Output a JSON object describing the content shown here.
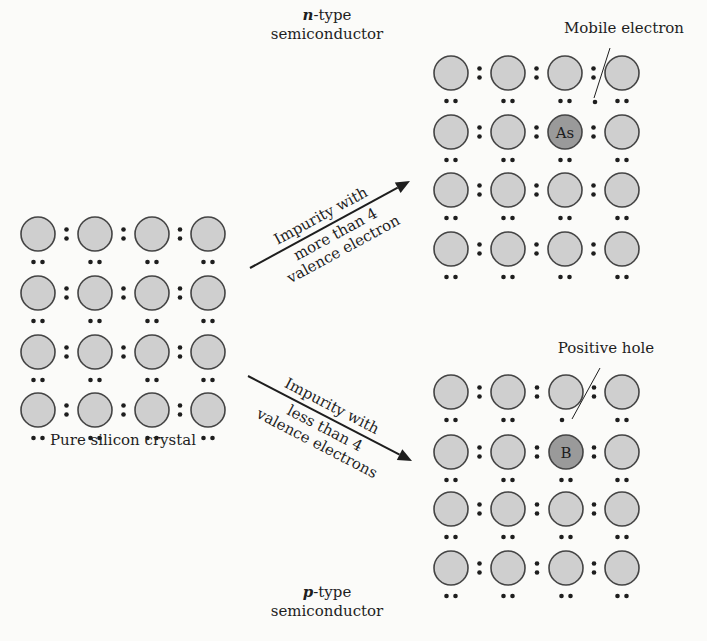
{
  "colors": {
    "background": "#fbfbf9",
    "atom_fill": "#cfcfcf",
    "atom_stroke": "#444444",
    "impurity_fill": "#9a9a9a",
    "ink": "#1e1e1e"
  },
  "atom_radius": 17,
  "grids": [
    {
      "id": "pure-silicon",
      "name": "pure-silicon-crystal",
      "caption": "Pure silicon crystal",
      "caption_pos": [
        123,
        445
      ],
      "cols_x": [
        38,
        95,
        152,
        208
      ],
      "rows_y": [
        234,
        293,
        352,
        410
      ],
      "impurity": null,
      "missing_bond": null,
      "extra_electron": null
    },
    {
      "id": "n-type",
      "name": "n-type-crystal",
      "cols_x": [
        451,
        508,
        565,
        622
      ],
      "rows_y": [
        73,
        132,
        190,
        249
      ],
      "impurity": {
        "row": 1,
        "col": 2,
        "symbol": "As"
      },
      "extra_electron": {
        "pos": [
          595,
          102
        ]
      },
      "missing_bond": {
        "row": 0,
        "col": 2
      },
      "annotation": {
        "text": "Mobile electron",
        "text_pos": [
          624,
          33
        ],
        "line": [
          610,
          48,
          594,
          98
        ]
      }
    },
    {
      "id": "p-type",
      "name": "p-type-crystal",
      "cols_x": [
        451,
        508,
        566,
        622
      ],
      "rows_y": [
        392,
        452,
        509,
        568
      ],
      "impurity": {
        "row": 1,
        "col": 2,
        "symbol": "B"
      },
      "single_dot_below": {
        "row": 0,
        "col": 2
      },
      "annotation": {
        "text": "Positive hole",
        "text_pos": [
          606,
          353
        ],
        "line": [
          600,
          368,
          572,
          419
        ]
      }
    }
  ],
  "titles": {
    "n_type": {
      "italic": "n",
      "rest": "-type",
      "line2": "semiconductor",
      "x": 327,
      "y1": 20,
      "y2": 39
    },
    "p_type": {
      "italic": "p",
      "rest": "-type",
      "line2": "semiconductor",
      "x": 327,
      "y1": 597,
      "y2": 616
    }
  },
  "arrows": [
    {
      "name": "arrow-to-n-type",
      "from": [
        250,
        268
      ],
      "to": [
        410,
        181
      ],
      "label_above": "Impurity with",
      "label_below": [
        "more than 4",
        "valence electron"
      ]
    },
    {
      "name": "arrow-to-p-type",
      "from": [
        248,
        376
      ],
      "to": [
        412,
        461
      ],
      "label_above": "Impurity with",
      "label_below": [
        "less than 4",
        "valence electrons"
      ]
    }
  ]
}
